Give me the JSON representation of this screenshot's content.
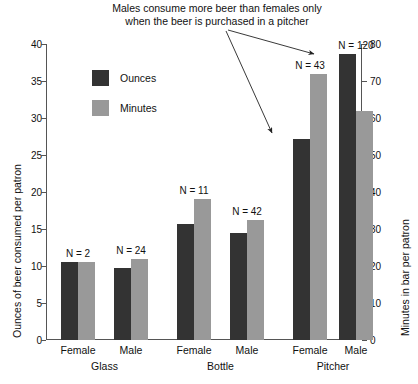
{
  "chart_data": {
    "type": "bar",
    "title": "",
    "annotation": "Males consume more beer than females only\nwhen the beer is purchased in a pitcher",
    "categories": [
      "Female",
      "Male",
      "Female",
      "Male",
      "Female",
      "Male"
    ],
    "groups": [
      "Glass",
      "Bottle",
      "Pitcher"
    ],
    "series": [
      {
        "name": "Ounces",
        "values": [
          10.5,
          9.7,
          15.7,
          14.4,
          27.2,
          38.7
        ],
        "color": "#333333",
        "axis": "left"
      },
      {
        "name": "Minutes",
        "values": [
          21,
          22,
          38,
          32.5,
          72,
          62
        ],
        "color": "#999999",
        "axis": "right"
      }
    ],
    "point_labels": [
      "N = 2",
      "N = 24",
      "N = 11",
      "N = 42",
      "N = 43",
      "N = 120"
    ],
    "xlabel": "",
    "ylabel": "Ounces of beer consumed per patron",
    "y2label": "Minutes in bar per patron",
    "ylim": [
      0,
      40
    ],
    "y2lim": [
      0,
      80
    ],
    "yticks": [
      "0",
      "5",
      "10",
      "15",
      "20",
      "25",
      "30",
      "35",
      "40"
    ],
    "y2ticks": [
      "0",
      "10",
      "20",
      "30",
      "40",
      "50",
      "60",
      "70",
      "80"
    ],
    "grid": false,
    "legend_position": "upper-left-inside",
    "legend": [
      "Ounces",
      "Minutes"
    ]
  },
  "axes": {
    "left_title": "Ounces of beer consumed per patron",
    "right_title": "Minutes in bar per patron"
  },
  "legend": {
    "ounces_label": "Ounces",
    "minutes_label": "Minutes"
  },
  "annotation": {
    "text": "Males consume more beer than females only\nwhen the beer is purchased in a pitcher"
  },
  "xaxis": {
    "ticks": [
      {
        "label": "Female"
      },
      {
        "label": "Male"
      },
      {
        "label": "Female"
      },
      {
        "label": "Male"
      },
      {
        "label": "Female"
      },
      {
        "label": "Male"
      }
    ],
    "groups": [
      {
        "label": "Glass"
      },
      {
        "label": "Bottle"
      },
      {
        "label": "Pitcher"
      }
    ]
  },
  "nlabels": [
    {
      "text": "N = 2"
    },
    {
      "text": "N = 24"
    },
    {
      "text": "N = 11"
    },
    {
      "text": "N = 42"
    },
    {
      "text": "N = 43"
    },
    {
      "text": "N = 120"
    }
  ],
  "caption": {
    "text": ""
  }
}
